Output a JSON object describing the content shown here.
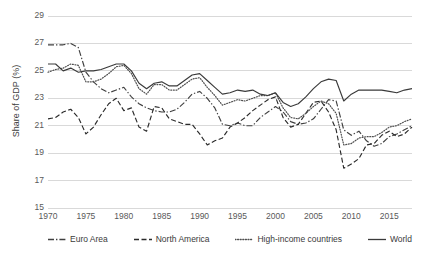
{
  "chart_data": {
    "type": "line",
    "title": "",
    "xlabel": "",
    "ylabel": "Share of GDP (%)",
    "ylim": [
      15,
      29
    ],
    "xlim": [
      1970,
      2018
    ],
    "yticks": [
      15,
      17,
      19,
      21,
      23,
      25,
      27,
      29
    ],
    "xticks": [
      1970,
      1975,
      1980,
      1985,
      1990,
      1995,
      2000,
      2005,
      2010,
      2015
    ],
    "grid": "horizontal",
    "legend_position": "bottom",
    "x": [
      1970,
      1971,
      1972,
      1973,
      1974,
      1975,
      1976,
      1977,
      1978,
      1979,
      1980,
      1981,
      1982,
      1983,
      1984,
      1985,
      1986,
      1987,
      1988,
      1989,
      1990,
      1991,
      1992,
      1993,
      1994,
      1995,
      1996,
      1997,
      1998,
      1999,
      2000,
      2001,
      2002,
      2003,
      2004,
      2005,
      2006,
      2007,
      2008,
      2009,
      2010,
      2011,
      2012,
      2013,
      2014,
      2015,
      2016,
      2017,
      2018
    ],
    "series": [
      {
        "name": "Euro Area",
        "style": "dash-dot",
        "color": "#404040",
        "values": [
          26.9,
          26.9,
          26.9,
          27.0,
          26.7,
          24.9,
          24.2,
          23.7,
          23.4,
          23.6,
          23.8,
          23.1,
          22.6,
          22.3,
          22.1,
          22.0,
          22.0,
          22.2,
          22.7,
          23.3,
          23.5,
          23.0,
          22.3,
          21.1,
          21.0,
          21.2,
          21.0,
          21.0,
          21.6,
          22.0,
          22.4,
          22.0,
          21.3,
          21.1,
          21.2,
          21.5,
          22.2,
          22.9,
          22.8,
          20.7,
          20.3,
          20.6,
          19.9,
          19.5,
          19.7,
          20.2,
          20.4,
          20.7,
          21.0
        ]
      },
      {
        "name": "North America",
        "style": "dashed",
        "color": "#2b2b2b",
        "values": [
          21.5,
          21.6,
          22.0,
          22.2,
          21.6,
          20.4,
          20.9,
          21.8,
          22.6,
          23.0,
          22.1,
          22.3,
          20.9,
          20.6,
          22.4,
          22.3,
          21.5,
          21.3,
          21.1,
          21.1,
          20.4,
          19.6,
          19.9,
          20.1,
          20.9,
          21.2,
          21.6,
          22.1,
          22.5,
          22.9,
          23.1,
          21.6,
          20.9,
          21.1,
          21.9,
          22.7,
          22.8,
          22.0,
          20.7,
          17.9,
          18.2,
          18.6,
          19.6,
          19.7,
          20.3,
          20.6,
          20.2,
          20.4,
          20.9
        ]
      },
      {
        "name": "High-income countries",
        "style": "dotted",
        "color": "#505050",
        "values": [
          24.9,
          25.1,
          25.2,
          25.5,
          25.4,
          24.2,
          24.2,
          24.4,
          24.8,
          25.3,
          25.4,
          24.8,
          23.7,
          23.3,
          24.0,
          24.0,
          23.6,
          23.6,
          24.0,
          24.4,
          24.5,
          23.8,
          23.2,
          22.5,
          22.7,
          22.9,
          22.8,
          23.0,
          23.2,
          23.2,
          23.4,
          22.3,
          21.6,
          21.5,
          21.9,
          22.4,
          22.8,
          22.6,
          21.9,
          19.6,
          19.7,
          20.1,
          20.2,
          20.2,
          20.5,
          20.9,
          21.0,
          21.3,
          21.5
        ]
      },
      {
        "name": "World",
        "style": "solid",
        "color": "#3a3a3a",
        "values": [
          25.5,
          25.5,
          25.0,
          25.2,
          24.9,
          25.0,
          25.0,
          25.1,
          25.3,
          25.5,
          25.5,
          25.0,
          24.1,
          23.7,
          24.1,
          24.2,
          23.9,
          23.9,
          24.3,
          24.7,
          24.8,
          24.3,
          23.8,
          23.3,
          23.4,
          23.6,
          23.5,
          23.6,
          23.3,
          23.2,
          23.4,
          22.7,
          22.4,
          22.6,
          23.1,
          23.7,
          24.2,
          24.4,
          24.3,
          22.8,
          23.3,
          23.6,
          23.6,
          23.6,
          23.6,
          23.5,
          23.4,
          23.6,
          23.7
        ]
      }
    ]
  },
  "legend": {
    "items": [
      {
        "label": "Euro Area",
        "swatch": "dash-dot-swatch"
      },
      {
        "label": "North America",
        "swatch": "dashed-swatch"
      },
      {
        "label": "High-income countries",
        "swatch": "dotted-swatch"
      },
      {
        "label": "World",
        "swatch": "solid-swatch"
      }
    ]
  },
  "axes": {
    "y_title": "Share of GDP (%)",
    "y_labels": [
      "29",
      "27",
      "25",
      "23",
      "21",
      "19",
      "17",
      "15"
    ],
    "x_labels": [
      "1970",
      "1975",
      "1980",
      "1985",
      "1990",
      "1995",
      "2000",
      "2005",
      "2010",
      "2015"
    ]
  }
}
